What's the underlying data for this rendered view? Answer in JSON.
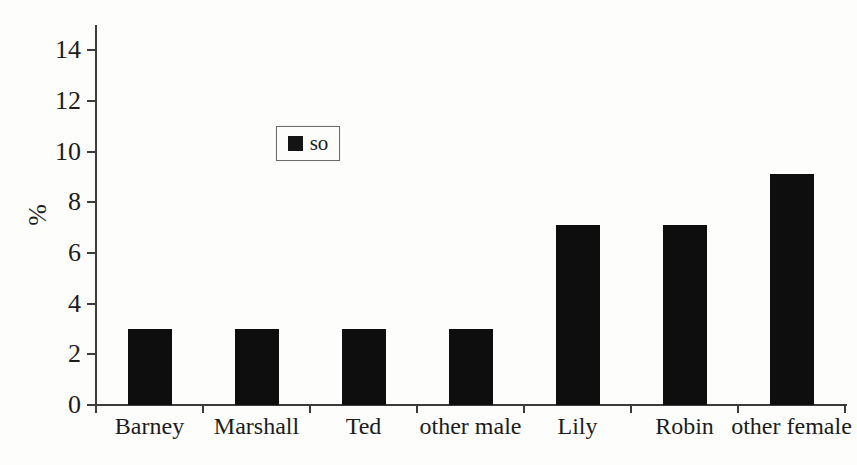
{
  "chart_data": {
    "type": "bar",
    "title": "",
    "xlabel": "",
    "ylabel": "%",
    "categories": [
      "Barney",
      "Marshall",
      "Ted",
      "other male",
      "Lily",
      "Robin",
      "other female"
    ],
    "series": [
      {
        "name": "so",
        "values": [
          3,
          3,
          3,
          3,
          7.1,
          7.1,
          9.1
        ]
      }
    ],
    "ylim": [
      0,
      15
    ],
    "yticks": [
      0,
      2,
      4,
      6,
      8,
      10,
      12,
      14
    ],
    "grid": false,
    "legend": {
      "position": "inside-upper-left",
      "entries": [
        "so"
      ]
    },
    "bar_color": "#0e0e0e",
    "axis_color": "#3c3c3c",
    "text_color": "#1c1c1c",
    "background_color": "#fdfdfc"
  }
}
